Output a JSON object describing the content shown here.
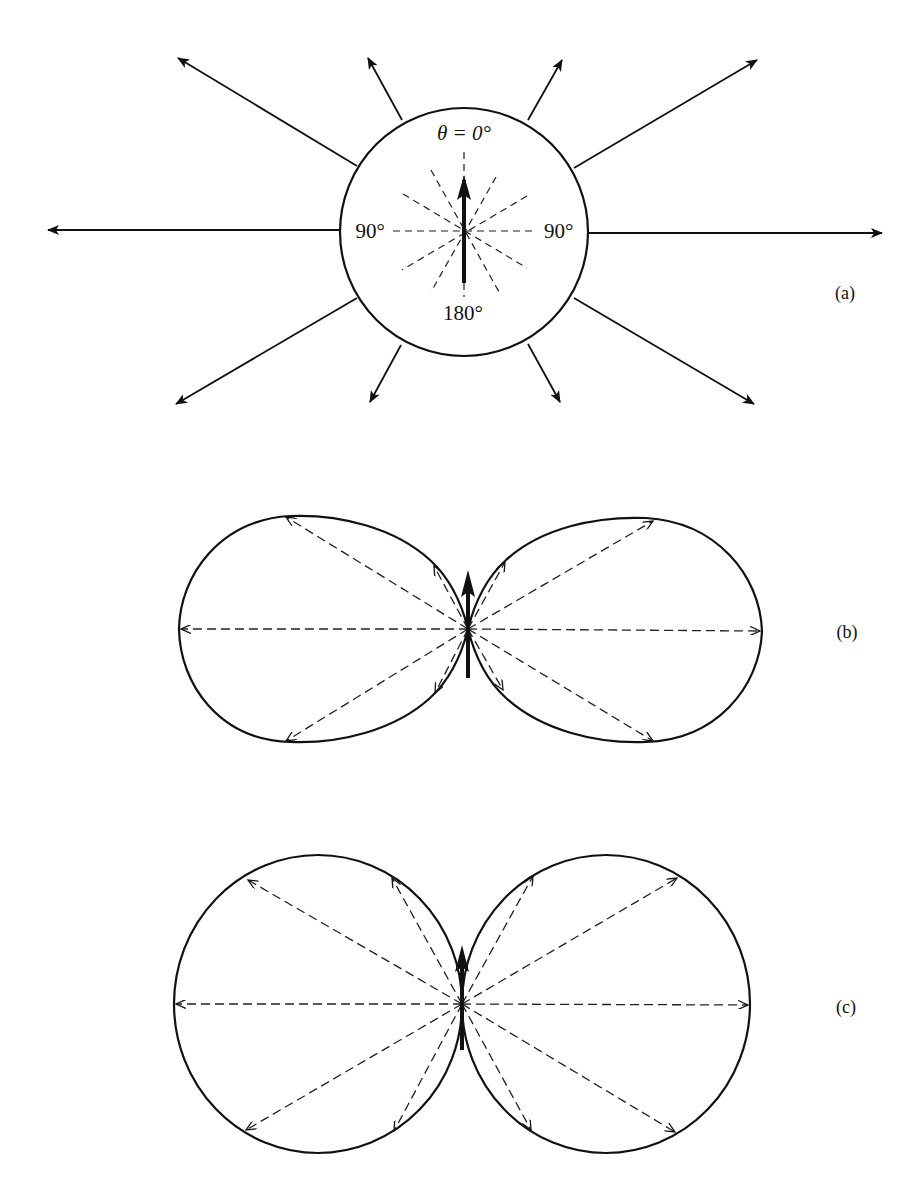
{
  "figure": {
    "panel_a": {
      "label": "(a)",
      "theta_label": "θ = 0°",
      "left_label": "90°",
      "right_label": "90°",
      "bottom_label": "180°",
      "description": "Isotropic emission: circle with radiating arrows of equal length"
    },
    "panel_b": {
      "label": "(b)",
      "description": "Dipole-like radiation pattern with elongated lobes"
    },
    "panel_c": {
      "label": "(c)",
      "description": "sin²θ dipole radiation pattern with circular lobes"
    },
    "colors": {
      "ink": "#111111",
      "background": "#ffffff"
    }
  }
}
